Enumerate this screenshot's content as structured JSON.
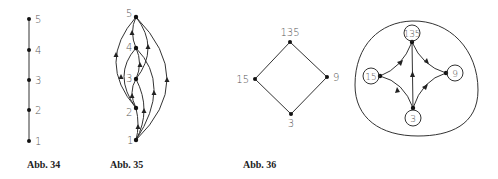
{
  "figures": [
    {
      "caption": "Abb. 34",
      "nodes": [
        {
          "label": "5",
          "x": 29,
          "y": 19
        },
        {
          "label": "4",
          "x": 29,
          "y": 50
        },
        {
          "label": "3",
          "x": 29,
          "y": 80
        },
        {
          "label": "2",
          "x": 29,
          "y": 110
        },
        {
          "label": "1",
          "x": 29,
          "y": 141
        }
      ]
    },
    {
      "caption": "Abb. 35",
      "nodes": [
        {
          "label": "5",
          "x": 136,
          "y": 17
        },
        {
          "label": "4",
          "x": 136,
          "y": 48
        },
        {
          "label": "3",
          "x": 136,
          "y": 79
        },
        {
          "label": "2",
          "x": 136,
          "y": 108
        },
        {
          "label": "1",
          "x": 136,
          "y": 140
        }
      ]
    },
    {
      "caption": "Abb. 36",
      "nodes": [
        {
          "label": "135",
          "x": 290,
          "y": 42
        },
        {
          "label": "15",
          "x": 255,
          "y": 79
        },
        {
          "label": "9",
          "x": 327,
          "y": 77
        },
        {
          "label": "3",
          "x": 291,
          "y": 114
        }
      ]
    },
    {
      "caption": "",
      "nodes": [
        {
          "label": "135",
          "x": 412,
          "y": 42
        },
        {
          "label": "15",
          "x": 380,
          "y": 76
        },
        {
          "label": "9",
          "x": 446,
          "y": 73
        },
        {
          "label": "3",
          "x": 413,
          "y": 108
        }
      ]
    }
  ]
}
